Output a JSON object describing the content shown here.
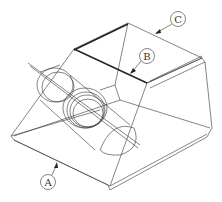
{
  "diagram": {
    "title": "",
    "callouts": [
      {
        "id": "A",
        "label": "A"
      },
      {
        "id": "B",
        "label": "B"
      },
      {
        "id": "C",
        "label": "C"
      }
    ],
    "colors": {
      "line": "#333333",
      "background": "#ffffff"
    }
  }
}
